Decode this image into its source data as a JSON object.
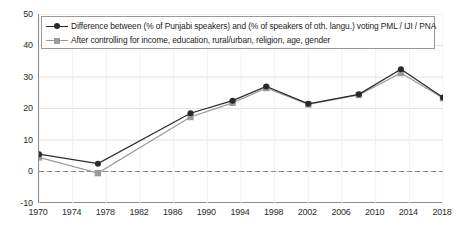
{
  "chart_data": {
    "type": "line",
    "title": "",
    "xlabel": "",
    "ylabel": "",
    "xlim": [
      1970,
      2018
    ],
    "ylim": [
      -10,
      50
    ],
    "grid": true,
    "legend_position": "top-left",
    "zero_line": true,
    "x_ticks": [
      "1970",
      "1974",
      "1978",
      "1982",
      "1986",
      "1990",
      "1994",
      "1998",
      "2002",
      "2006",
      "2010",
      "2014",
      "2018"
    ],
    "y_ticks": [
      "50",
      "40",
      "30",
      "20",
      "10",
      "0",
      "-10"
    ],
    "x": [
      1970,
      1977,
      1988,
      1993,
      1997,
      2002,
      2008,
      2013,
      2018
    ],
    "series": [
      {
        "name": "Difference between (% of Punjabi speakers) and (% of speakers of oth. langu.) voting PML / IJI / PNA",
        "color": "#2a2a2a",
        "marker": "circle",
        "values": [
          5.5,
          2.5,
          18.5,
          22.5,
          27.0,
          21.5,
          24.5,
          32.5,
          23.5
        ]
      },
      {
        "name": "After controlling for income, education, rural/urban, religion, age, gender",
        "color": "#9a9a9a",
        "marker": "square",
        "values": [
          4.5,
          -0.5,
          17.3,
          21.8,
          26.5,
          21.3,
          24.3,
          31.3,
          23.3
        ]
      }
    ]
  },
  "colors": {
    "series_dark": "#2a2a2a",
    "series_gray": "#9a9a9a",
    "axis": "#8c8c8c",
    "gridline": "#e2e2e2",
    "zero_line": "#8a8a8a",
    "background": "#ffffff"
  }
}
